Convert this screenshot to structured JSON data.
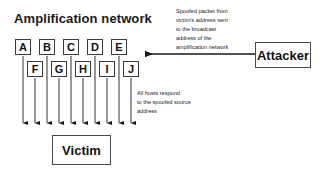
{
  "diagram": {
    "title": "Amplification network",
    "type": "network-attack-diagram"
  },
  "nodes": {
    "top_row": [
      {
        "label": "A",
        "x": 15,
        "y": 39
      },
      {
        "label": "B",
        "x": 39,
        "y": 39
      },
      {
        "label": "C",
        "x": 63,
        "y": 39
      },
      {
        "label": "D",
        "x": 87,
        "y": 39
      },
      {
        "label": "E",
        "x": 111,
        "y": 39
      }
    ],
    "bottom_row": [
      {
        "label": "F",
        "x": 27,
        "y": 61
      },
      {
        "label": "G",
        "x": 51,
        "y": 61
      },
      {
        "label": "H",
        "x": 75,
        "y": 61
      },
      {
        "label": "I",
        "x": 99,
        "y": 61
      },
      {
        "label": "J",
        "x": 123,
        "y": 61
      }
    ]
  },
  "entities": {
    "attacker": "Attacker",
    "victim": "Victim"
  },
  "annotations": {
    "spoofed_packet": "Spoofed packet from\nvictim's address sent\nto the broadcast\naddress of the\namplification network",
    "hosts_respond": "All hosts respond\nto the spoofed source\naddress"
  },
  "arrows": {
    "attacker_to_network": {
      "from_x": 255,
      "to_x": 143,
      "y": 54,
      "direction": "left"
    },
    "hosts_to_victim": {
      "count": 10,
      "end_y": 128,
      "direction": "down",
      "x_positions": [
        {
          "x": 23,
          "start_y": 56
        },
        {
          "x": 35,
          "start_y": 78
        },
        {
          "x": 47,
          "start_y": 56
        },
        {
          "x": 59,
          "start_y": 78
        },
        {
          "x": 71,
          "start_y": 56
        },
        {
          "x": 83,
          "start_y": 78
        },
        {
          "x": 95,
          "start_y": 56
        },
        {
          "x": 107,
          "start_y": 78
        },
        {
          "x": 119,
          "start_y": 56
        },
        {
          "x": 131,
          "start_y": 78
        }
      ]
    }
  },
  "colors": {
    "background": "#ffffff",
    "stroke": "#3a3a3a",
    "text": "#111111",
    "arrow": "#1a1a1a"
  }
}
